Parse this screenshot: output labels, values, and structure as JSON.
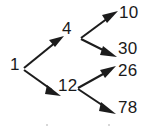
{
  "diagram": {
    "type": "binary-tree",
    "title": "",
    "background_color": "#ffffff",
    "stroke_color": "#1c1c1c",
    "text_color": "#1a1a1a",
    "nodes": [
      {
        "id": "root",
        "label": "1",
        "x": 14,
        "y": 64,
        "level": 0
      },
      {
        "id": "n4",
        "label": "4",
        "x": 68,
        "y": 28,
        "level": 1
      },
      {
        "id": "n12",
        "label": "12",
        "x": 64,
        "y": 85,
        "level": 1
      },
      {
        "id": "n10",
        "label": "10",
        "x": 124,
        "y": 13,
        "level": 2
      },
      {
        "id": "n30",
        "label": "30",
        "x": 122,
        "y": 48,
        "level": 2
      },
      {
        "id": "n26",
        "label": "26",
        "x": 122,
        "y": 71,
        "level": 2
      },
      {
        "id": "n78",
        "label": "78",
        "x": 122,
        "y": 108,
        "level": 2
      }
    ],
    "edges": [
      {
        "id": "e-root-4",
        "from": "root",
        "to": "n4",
        "direction": "up-right",
        "arrow": true
      },
      {
        "id": "e-root-12",
        "from": "root",
        "to": "n12",
        "direction": "down-right",
        "arrow": true
      },
      {
        "id": "e-4-10",
        "from": "n4",
        "to": "n10",
        "direction": "up-right",
        "arrow": true
      },
      {
        "id": "e-4-30",
        "from": "n4",
        "to": "n30",
        "direction": "down-right",
        "arrow": true
      },
      {
        "id": "e-12-26",
        "from": "n12",
        "to": "n26",
        "direction": "up-right",
        "arrow": true
      },
      {
        "id": "e-12-78",
        "from": "n12",
        "to": "n78",
        "direction": "down-right",
        "arrow": true
      }
    ]
  }
}
